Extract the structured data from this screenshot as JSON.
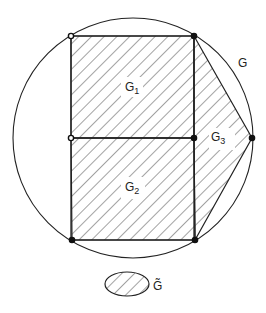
{
  "diagram": {
    "labels": {
      "G": "G",
      "G1": "G",
      "G1_sub": "1",
      "G2": "G",
      "G2_sub": "2",
      "G3": "G",
      "G3_sub": "3",
      "G_tilde": "G̃"
    },
    "colors": {
      "stroke": "#222222",
      "background": "#ffffff"
    },
    "circle": {
      "cx": 133,
      "cy": 138,
      "r": 120
    },
    "points": [
      {
        "name": "top-left",
        "x": 71,
        "y": 36
      },
      {
        "name": "top-right",
        "x": 194,
        "y": 36
      },
      {
        "name": "mid-left",
        "x": 71,
        "y": 138
      },
      {
        "name": "mid-right",
        "x": 194,
        "y": 138
      },
      {
        "name": "far-right",
        "x": 252,
        "y": 138
      },
      {
        "name": "bottom-left",
        "x": 72,
        "y": 240
      },
      {
        "name": "bottom-right",
        "x": 195,
        "y": 240
      }
    ],
    "regions": [
      {
        "name": "G1",
        "shape": "square",
        "description": "upper square, hatched"
      },
      {
        "name": "G2",
        "shape": "square",
        "description": "lower square, hatched"
      },
      {
        "name": "G3",
        "shape": "polygon",
        "description": "right polygon between squares and circle point, hatched"
      },
      {
        "name": "G",
        "shape": "circle",
        "description": "enclosing circle"
      },
      {
        "name": "G_tilde",
        "shape": "ellipse",
        "description": "small hatched ellipse legend"
      }
    ]
  }
}
